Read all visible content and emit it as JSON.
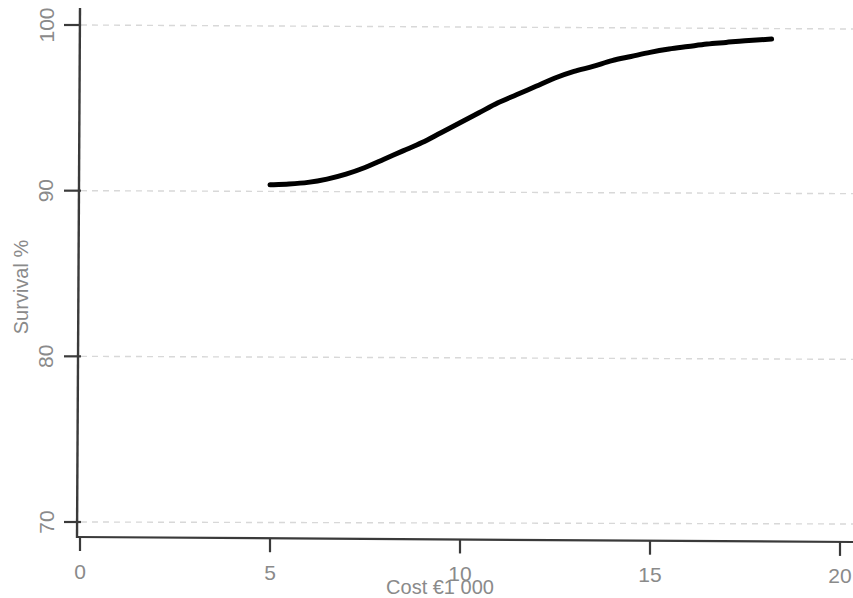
{
  "chart_data": {
    "type": "line",
    "title": "",
    "xlabel": "Cost €1 000",
    "ylabel": "Survival %",
    "xlim": [
      0,
      20
    ],
    "ylim": [
      67.5,
      101.5
    ],
    "grid": true,
    "grid_axis": "y",
    "legend": "none",
    "xticks": [
      0,
      5,
      10,
      15,
      20
    ],
    "xtick_labels": [
      "0",
      "5",
      "10",
      "15",
      "20"
    ],
    "yticks": [
      70,
      80,
      90,
      100
    ],
    "ytick_labels": [
      "70",
      "80",
      "90",
      "100"
    ],
    "series": [
      {
        "name": "Survival vs cost",
        "color": "#000000",
        "line_width": 5,
        "x": [
          5.0,
          5.5,
          6.0,
          6.5,
          7.0,
          7.5,
          8.0,
          8.5,
          9.0,
          9.5,
          10.0,
          10.5,
          11.0,
          11.5,
          12.0,
          12.5,
          13.0,
          13.5,
          14.0,
          14.5,
          15.0,
          15.5,
          16.0,
          16.5,
          17.0,
          17.5,
          18.2
        ],
        "y": [
          90.35,
          90.4,
          90.5,
          90.7,
          91.0,
          91.4,
          91.9,
          92.4,
          92.9,
          93.5,
          94.1,
          94.7,
          95.3,
          95.8,
          96.3,
          96.8,
          97.2,
          97.5,
          97.85,
          98.1,
          98.35,
          98.55,
          98.7,
          98.85,
          98.95,
          99.05,
          99.15
        ]
      }
    ],
    "colors": {
      "background": "#ffffff",
      "axis": "#3a3a3a",
      "gridline": "#d8d8d8",
      "tick_label": "#8a8a8a",
      "axis_title": "#8a8a8a",
      "curve": "#000000"
    }
  }
}
